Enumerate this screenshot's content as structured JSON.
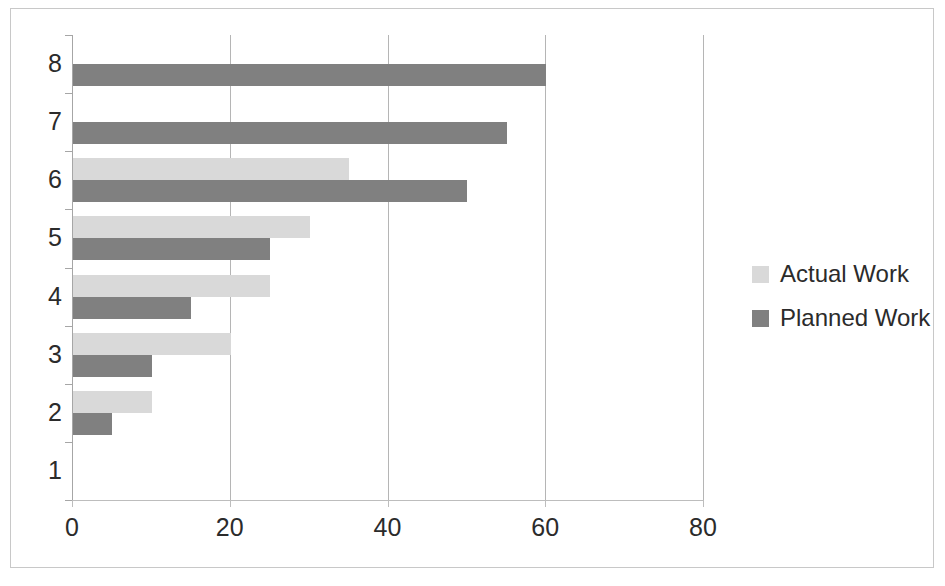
{
  "chart_data": {
    "type": "bar",
    "orientation": "horizontal",
    "title": "",
    "xlabel": "",
    "ylabel": "",
    "categories": [
      "1",
      "2",
      "3",
      "4",
      "5",
      "6",
      "7",
      "8"
    ],
    "series": [
      {
        "name": "Actual Work",
        "color": "#d9d9d9",
        "values": [
          0,
          10,
          20,
          25,
          30,
          35,
          0,
          0
        ]
      },
      {
        "name": "Planned Work",
        "color": "#808080",
        "values": [
          0,
          5,
          10,
          15,
          25,
          50,
          55,
          60
        ]
      }
    ],
    "xlim": [
      0,
      80
    ],
    "xticks": [
      0,
      20,
      40,
      60,
      80
    ],
    "xtick_labels": [
      "0",
      "20",
      "40",
      "60",
      "80"
    ],
    "ytick_labels": [
      "8",
      "7",
      "6",
      "5",
      "4",
      "3",
      "2",
      "1"
    ],
    "grid": "vertical",
    "legend_position": "right",
    "legend": [
      {
        "label": "Actual Work",
        "color": "#d9d9d9"
      },
      {
        "label": "Planned Work",
        "color": "#808080"
      }
    ]
  }
}
